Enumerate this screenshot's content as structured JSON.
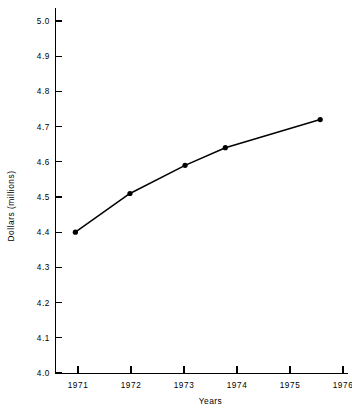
{
  "chart_data": {
    "type": "line",
    "title": "",
    "xlabel": "Years",
    "ylabel": "Dollars (millions)",
    "xlim": [
      1970.6,
      1976.15
    ],
    "ylim": [
      4.0,
      5.0
    ],
    "grid": false,
    "legend": null,
    "x": [
      1970.95,
      1971.98,
      1973.02,
      1973.78,
      1975.57
    ],
    "values": [
      4.4,
      4.51,
      4.59,
      4.64,
      4.72
    ],
    "series": [
      {
        "name": "Dollars (millions)",
        "x": [
          1970.95,
          1971.98,
          1973.02,
          1973.78,
          1975.57
        ],
        "values": [
          4.4,
          4.51,
          4.59,
          4.64,
          4.72
        ],
        "marker": "filled-circle",
        "color": "#000000"
      }
    ],
    "x_ticks": [
      1971,
      1972,
      1973,
      1974,
      1975,
      1976
    ],
    "x_tick_labels": [
      "1971",
      "1972",
      "1973",
      "1974",
      "1975",
      "1976"
    ],
    "y_ticks": [
      4.0,
      4.1,
      4.2,
      4.3,
      4.4,
      4.5,
      4.6,
      4.7,
      4.8,
      4.9,
      5.0
    ],
    "y_tick_labels": [
      "4.0",
      "4.1",
      "4.2",
      "4.3",
      "4.4",
      "4.5",
      "4.6",
      "4.7",
      "4.8",
      "4.9",
      "5.0"
    ]
  },
  "colors": {
    "background": "#ffffff",
    "axis": "#000000",
    "series": "#000000"
  }
}
